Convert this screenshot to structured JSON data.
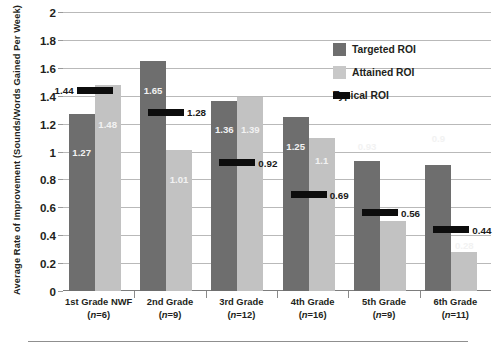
{
  "chart_data": {
    "type": "bar",
    "title": "",
    "xlabel": "",
    "ylabel": "Average Rate of Improvement (Sounds/Words Gained Per Week)",
    "ylim": [
      0,
      2
    ],
    "ytick_values": [
      0,
      0.2,
      0.4,
      0.6,
      0.8,
      1,
      1.2,
      1.4,
      1.6,
      1.8,
      2
    ],
    "ytick_labels": [
      "0",
      "0.2",
      "0.4",
      "0.6",
      "0.8",
      "1",
      "1.2",
      "1.4",
      "1.6",
      "1.8",
      "2"
    ],
    "grid": true,
    "legend_position": "upper-right",
    "categories": [
      "1st Grade NWF",
      "2nd Grade",
      "3rd Grade",
      "4th Grade",
      "5th Grade",
      "6th Grade"
    ],
    "category_counts": [
      "(n=6)",
      "(n=9)",
      "(n=12)",
      "(n=16)",
      "(n=9)",
      "(n=11)"
    ],
    "series": [
      {
        "name": "Targeted ROI",
        "color": "#6e6e6e",
        "values": [
          1.27,
          1.65,
          1.36,
          1.25,
          0.93,
          0.9
        ],
        "labels": [
          "1.27",
          "1.65",
          "1.36",
          "1.25",
          "0.93",
          "0.9"
        ]
      },
      {
        "name": "Attained ROI",
        "color": "#c2c2c2",
        "values": [
          1.48,
          1.01,
          1.39,
          1.1,
          0.5,
          0.28
        ],
        "labels": [
          "1.48",
          "1.01",
          "1.39",
          "1.1",
          "0.5",
          "0.28"
        ]
      },
      {
        "name": "Typical ROI",
        "color": "#0d0d0d",
        "values": [
          1.44,
          1.28,
          0.92,
          0.69,
          0.56,
          0.44
        ],
        "labels": [
          "1.44",
          "1.28",
          "0.92",
          "0.69",
          "0.56",
          "0.44"
        ]
      }
    ]
  },
  "legend": {
    "items": [
      {
        "label": "Targeted ROI",
        "color": "#6e6e6e",
        "kind": "square"
      },
      {
        "label": "Attained ROI",
        "color": "#c8c8c8",
        "kind": "square"
      },
      {
        "label": "Typical ROI",
        "color": "#0d0d0d",
        "kind": "dash"
      }
    ]
  },
  "axis": {
    "y_title": "Average Rate of Improvement (Sounds/Words Gained Per Week)"
  }
}
